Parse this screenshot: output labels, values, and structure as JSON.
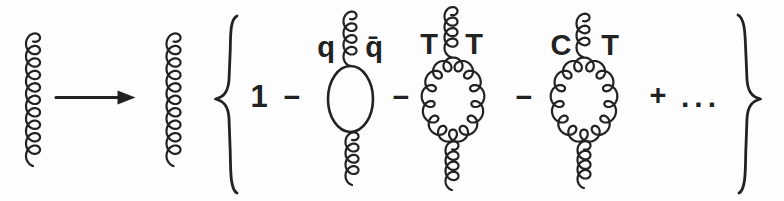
{
  "colors": {
    "ink": "#222222",
    "paper": "#fdfdfd"
  },
  "equation": {
    "one": "1",
    "minus": "−",
    "plus": "+",
    "ellipsis": "...",
    "loops": {
      "quark": {
        "left_label": "q",
        "right_label": "q̄"
      },
      "gluon_tt": {
        "left_label": "T",
        "right_label": "T"
      },
      "gluon_ct": {
        "left_label": "C",
        "right_label": "T"
      }
    }
  }
}
